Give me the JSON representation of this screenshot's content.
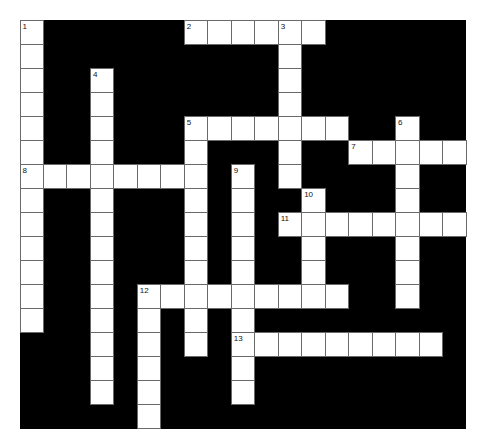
{
  "puzzle": {
    "cols": 19,
    "rows": 17,
    "colors": {
      "block": "#000000",
      "cell": "#ffffff",
      "grid_line": "#6a6a6a"
    },
    "entries": [
      {
        "number": "1",
        "direction": "down",
        "row": 0,
        "col": 0,
        "length": 13
      },
      {
        "number": "2",
        "direction": "across",
        "row": 0,
        "col": 7,
        "length": 6
      },
      {
        "number": "3",
        "direction": "down",
        "row": 0,
        "col": 11,
        "length": 7
      },
      {
        "number": "4",
        "direction": "down",
        "row": 2,
        "col": 3,
        "length": 14
      },
      {
        "number": "5",
        "direction": "across",
        "row": 4,
        "col": 7,
        "length": 7
      },
      {
        "number": "5",
        "direction": "down",
        "row": 4,
        "col": 7,
        "length": 10
      },
      {
        "number": "6",
        "direction": "down",
        "row": 4,
        "col": 16,
        "length": 8
      },
      {
        "number": "7",
        "direction": "across",
        "row": 5,
        "col": 14,
        "length": 5
      },
      {
        "number": "8",
        "direction": "across",
        "row": 6,
        "col": 0,
        "length": 8
      },
      {
        "number": "9",
        "direction": "down",
        "row": 6,
        "col": 9,
        "length": 10
      },
      {
        "number": "10",
        "direction": "down",
        "row": 7,
        "col": 12,
        "length": 5
      },
      {
        "number": "11",
        "direction": "across",
        "row": 8,
        "col": 11,
        "length": 8
      },
      {
        "number": "12",
        "direction": "across",
        "row": 11,
        "col": 5,
        "length": 9
      },
      {
        "number": "12",
        "direction": "down",
        "row": 11,
        "col": 5,
        "length": 6
      },
      {
        "number": "13",
        "direction": "across",
        "row": 13,
        "col": 9,
        "length": 9
      }
    ]
  }
}
